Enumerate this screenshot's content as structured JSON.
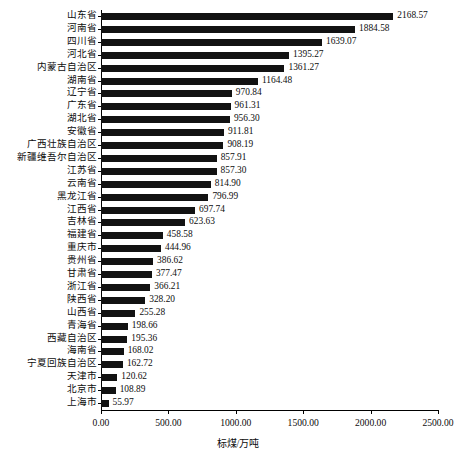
{
  "chart_data": {
    "type": "bar",
    "orientation": "horizontal",
    "title": "",
    "subtitle": "",
    "xlabel": "标煤/万吨",
    "ylabel": "",
    "xlim": [
      0,
      2500
    ],
    "grid": false,
    "legend": null,
    "bar_color": "#121212",
    "x_ticks": [
      "0.00",
      "500.00",
      "1000.00",
      "1500.00",
      "2000.00",
      "2500.00"
    ],
    "x_tick_values": [
      0,
      500,
      1000,
      1500,
      2000,
      2500
    ],
    "categories": [
      "山东省",
      "河南省",
      "四川省",
      "河北省",
      "内蒙古自治区",
      "湖南省",
      "辽宁省",
      "广东省",
      "湖北省",
      "安徽省",
      "广西壮族自治区",
      "新疆维吾尔自治区",
      "江苏省",
      "云南省",
      "黑龙江省",
      "江西省",
      "吉林省",
      "福建省",
      "重庆市",
      "贵州省",
      "甘肃省",
      "浙江省",
      "陕西省",
      "山西省",
      "青海省",
      "西藏自治区",
      "海南省",
      "宁夏回族自治区",
      "天津市",
      "北京市",
      "上海市"
    ],
    "values": [
      2168.57,
      1884.58,
      1639.07,
      1395.27,
      1361.27,
      1164.48,
      970.84,
      961.31,
      956.3,
      911.81,
      908.19,
      857.91,
      857.3,
      814.9,
      796.99,
      697.74,
      623.63,
      458.58,
      444.96,
      386.62,
      377.47,
      366.21,
      328.2,
      255.28,
      198.66,
      195.36,
      168.02,
      162.72,
      120.62,
      108.89,
      55.97
    ],
    "value_labels": [
      "2168.57",
      "1884.58",
      "1639.07",
      "1395.27",
      "1361.27",
      "1164.48",
      "970.84",
      "961.31",
      "956.30",
      "911.81",
      "908.19",
      "857.91",
      "857.30",
      "814.90",
      "796.99",
      "697.74",
      "623.63",
      "458.58",
      "444.96",
      "386.62",
      "377.47",
      "366.21",
      "328.20",
      "255.28",
      "198.66",
      "195.36",
      "168.02",
      "162.72",
      "120.62",
      "108.89",
      "55.97"
    ]
  }
}
